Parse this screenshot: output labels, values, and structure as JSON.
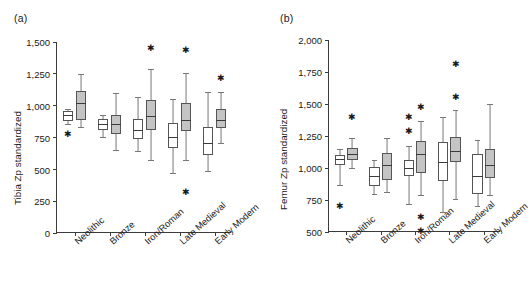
{
  "figure": {
    "width": 532,
    "height": 306,
    "background": "#ffffff",
    "box_open_color": "#ffffff",
    "box_filled_color": "#c4c4c4",
    "line_color": "#3b3b3b"
  },
  "chart_data": [
    {
      "type": "box",
      "panel": "a",
      "panel_label": "(a)",
      "title": "",
      "xlabel": "",
      "ylabel": "Tibia Zp standardized",
      "ylim": [
        0,
        1500
      ],
      "yticks": [
        0,
        250,
        500,
        750,
        1000,
        1250,
        1500
      ],
      "ytick_labels": [
        "0",
        "250",
        "500",
        "750",
        "1,000",
        "1,250",
        "1,500"
      ],
      "grid": false,
      "legend": "none",
      "categories": [
        "Neolithic",
        "Bronze",
        "Iron/Roman",
        "Late Medieval",
        "Early Modern"
      ],
      "series": [
        {
          "name": "open",
          "fill": "#ffffff",
          "boxes": [
            {
              "category": "Neolithic",
              "whisker_low": 855,
              "q1": 880,
              "median": 930,
              "q3": 955,
              "whisker_high": 975,
              "outliers": [
                775
              ]
            },
            {
              "category": "Bronze",
              "whisker_low": 755,
              "q1": 805,
              "median": 855,
              "q3": 895,
              "whisker_high": 925,
              "outliers": []
            },
            {
              "category": "Iron/Roman",
              "whisker_low": 645,
              "q1": 740,
              "median": 805,
              "q3": 895,
              "whisker_high": 1070,
              "outliers": []
            },
            {
              "category": "Late Medieval",
              "whisker_low": 475,
              "q1": 665,
              "median": 755,
              "q3": 860,
              "whisker_high": 1055,
              "outliers": []
            },
            {
              "category": "Early Modern",
              "whisker_low": 490,
              "q1": 615,
              "median": 710,
              "q3": 830,
              "whisker_high": 1105,
              "outliers": []
            }
          ]
        },
        {
          "name": "filled",
          "fill": "#c4c4c4",
          "boxes": [
            {
              "category": "Neolithic",
              "whisker_low": 830,
              "q1": 890,
              "median": 1020,
              "q3": 1115,
              "whisker_high": 1250,
              "outliers": []
            },
            {
              "category": "Bronze",
              "whisker_low": 650,
              "q1": 780,
              "median": 855,
              "q3": 930,
              "whisker_high": 1100,
              "outliers": []
            },
            {
              "category": "Iron/Roman",
              "whisker_low": 570,
              "q1": 810,
              "median": 915,
              "q3": 1045,
              "whisker_high": 1290,
              "outliers": [
                1450
              ]
            },
            {
              "category": "Late Medieval",
              "whisker_low": 575,
              "q1": 800,
              "median": 890,
              "q3": 1020,
              "whisker_high": 1255,
              "outliers": [
                1440,
                325
              ]
            },
            {
              "category": "Early Modern",
              "whisker_low": 705,
              "q1": 825,
              "median": 885,
              "q3": 975,
              "whisker_high": 1110,
              "outliers": [
                1220
              ]
            }
          ]
        }
      ]
    },
    {
      "type": "box",
      "panel": "b",
      "panel_label": "(b)",
      "title": "",
      "xlabel": "",
      "ylabel": "Femur Zp standardized",
      "ylim": [
        500,
        2000
      ],
      "yticks": [
        500,
        750,
        1000,
        1250,
        1500,
        1750,
        2000
      ],
      "ytick_labels": [
        "500",
        "750",
        "1,000",
        "1,250",
        "1,500",
        "1,750",
        "2,000"
      ],
      "grid": false,
      "legend": "none",
      "categories": [
        "Neolithic",
        "Bronze",
        "Iron/Roman",
        "Late Medieval",
        "Early Modern"
      ],
      "series": [
        {
          "name": "open",
          "fill": "#ffffff",
          "boxes": [
            {
              "category": "Neolithic",
              "whisker_low": 865,
              "q1": 1020,
              "median": 1070,
              "q3": 1105,
              "whisker_high": 1150,
              "outliers": [
                700
              ]
            },
            {
              "category": "Bronze",
              "whisker_low": 800,
              "q1": 860,
              "median": 935,
              "q3": 1010,
              "whisker_high": 1060,
              "outliers": []
            },
            {
              "category": "Iron/Roman",
              "whisker_low": 720,
              "q1": 935,
              "median": 1000,
              "q3": 1065,
              "whisker_high": 1175,
              "outliers": [
                1290,
                1400
              ]
            },
            {
              "category": "Late Medieval",
              "whisker_low": 655,
              "q1": 895,
              "median": 1045,
              "q3": 1205,
              "whisker_high": 1400,
              "outliers": []
            },
            {
              "category": "Early Modern",
              "whisker_low": 700,
              "q1": 800,
              "median": 935,
              "q3": 1110,
              "whisker_high": 1215,
              "outliers": []
            }
          ]
        },
        {
          "name": "filled",
          "fill": "#c4c4c4",
          "boxes": [
            {
              "category": "Neolithic",
              "whisker_low": 1000,
              "q1": 1065,
              "median": 1110,
              "q3": 1155,
              "whisker_high": 1235,
              "outliers": [
                1400
              ]
            },
            {
              "category": "Bronze",
              "whisker_low": 810,
              "q1": 905,
              "median": 1025,
              "q3": 1115,
              "whisker_high": 1235,
              "outliers": []
            },
            {
              "category": "Iron/Roman",
              "whisker_low": 790,
              "q1": 960,
              "median": 1110,
              "q3": 1210,
              "whisker_high": 1365,
              "outliers": [
                1480,
                615,
                505
              ]
            },
            {
              "category": "Late Medieval",
              "whisker_low": 760,
              "q1": 1045,
              "median": 1130,
              "q3": 1245,
              "whisker_high": 1455,
              "outliers": [
                1555,
                1810
              ]
            },
            {
              "category": "Early Modern",
              "whisker_low": 790,
              "q1": 925,
              "median": 1025,
              "q3": 1150,
              "whisker_high": 1500,
              "outliers": []
            }
          ]
        }
      ]
    }
  ]
}
